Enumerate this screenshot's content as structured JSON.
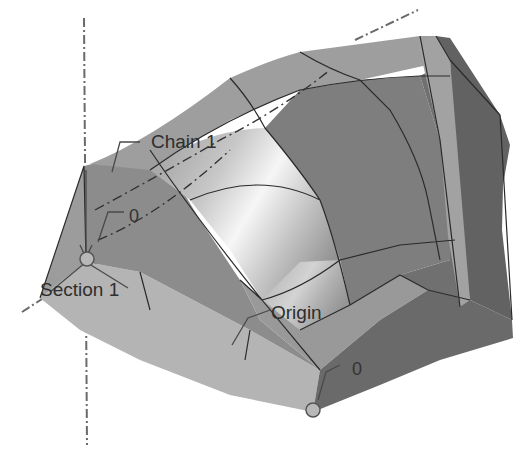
{
  "viewport": {
    "background": "#ffffff",
    "description": "3D CAD loft surface viewport"
  },
  "labels": {
    "chain": "Chain 1",
    "section": "Section 1",
    "origin": "Origin",
    "offset_top": "0",
    "offset_bottom": "0"
  },
  "colors": {
    "surface_light": "#b0b0b0",
    "surface_mid": "#8e8e8e",
    "surface_dark": "#6e6e6e",
    "surface_darkest": "#5e5e5e",
    "highlight": "#f4f4f4",
    "strip": "#a6a6a6",
    "axis": "#6a6a6a",
    "text": "#2e2e2e"
  }
}
